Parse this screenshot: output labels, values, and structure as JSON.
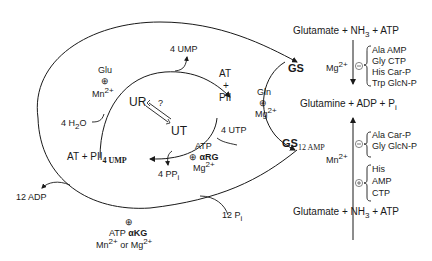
{
  "left_cycle": {
    "glu_effector": {
      "ligand": "Glu",
      "sign": "⊕",
      "ion": "Mn",
      "ion_charge": "2+"
    },
    "ump_release": "4 UMP",
    "water": "4 H",
    "water_sub": "2",
    "water_tail": "O",
    "ur": "UR",
    "ut": "UT",
    "question": "?",
    "at_top": "AT",
    "plus_top": "+",
    "pii": "PII",
    "utp": "4 UTP",
    "at_pii_ump": "AT + PII",
    "at_pii_ump_sub": "4 UMP",
    "ppi": "4 PP",
    "ppi_sub": "i",
    "ut_effectors": {
      "l1": "ATP",
      "sign": "⊕",
      "l2": "αRG",
      "l3": "Mg",
      "l3_charge": "2+"
    }
  },
  "outer_cycle": {
    "adp": "12 ADP",
    "pi": "12 P",
    "pi_sub": "i",
    "effectors": {
      "sign": "⊕",
      "l1": "ATP  αKG",
      "l2a": "Mn",
      "l2a_charge": "2+",
      "l2b": " or Mg",
      "l2b_charge": "2+"
    }
  },
  "middle": {
    "gln": "Gln",
    "sign": "⊕",
    "ion": "Mg",
    "ion_charge": "2+",
    "gs": "GS",
    "gs12": "GS",
    "gs12_sub": "12 AMP"
  },
  "right_panel": {
    "top_reactants": {
      "a": "Glutamate + NH",
      "sub": "3",
      "b": " + ATP"
    },
    "mg_label": "Mg",
    "mg_charge": "2+",
    "inhib_sign_top": "⊖",
    "top_inhibitors": [
      "Ala  AMP",
      "Gly  CTP",
      "His  Car-P",
      "Trp  GlcN-P"
    ],
    "products": {
      "a": "Glutamine + ADP + P",
      "sub": "i"
    },
    "inhib_sign_bottom": "⊖",
    "bottom_inhibitors": [
      "Ala  Car-P",
      "Gly  GlcN-P"
    ],
    "mn_label": "Mn",
    "mn_charge": "2+",
    "activ_sign": "⊕",
    "activators": [
      "His",
      "AMP",
      "CTP"
    ],
    "bottom_reactants": {
      "a": "Glutamate + NH",
      "sub": "3",
      "b": " + ATP"
    }
  }
}
